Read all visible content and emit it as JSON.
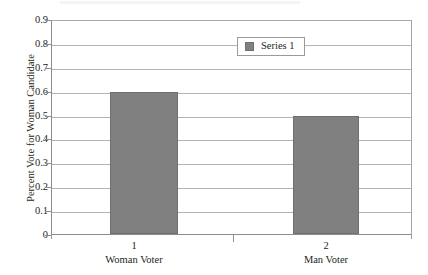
{
  "chart_data": {
    "type": "bar",
    "title": "",
    "subtitle": "",
    "xlabel": "",
    "ylabel": "Percent Vote for Woman Candidate",
    "categories": [
      "1",
      "2"
    ],
    "group_labels": [
      "Woman Voter",
      "Man Voter"
    ],
    "series": [
      {
        "name": "Series 1",
        "values": [
          0.6,
          0.5
        ],
        "color": "#808080"
      }
    ],
    "ylim": [
      0,
      0.9
    ],
    "ytick_step": 0.1,
    "ytick_labels": [
      "0.9",
      "0.8",
      "0.7",
      "0.6",
      "0.5",
      "0.4",
      "0.3",
      "0.2",
      "0.1",
      "0"
    ],
    "ytick_values": [
      0.9,
      0.8,
      0.7,
      0.6,
      0.5,
      0.4,
      0.3,
      0.2,
      0.1,
      0
    ],
    "grid": "horizontal",
    "legend": {
      "position": "inside-upper-right",
      "entries": [
        "Series 1"
      ]
    },
    "colors": {
      "bar_fill": "#808080",
      "bar_edge": "#6f6f6f",
      "gridline": "#b4b4b4",
      "axis": "#8d8d8d",
      "text": "#231f20",
      "background": "#ffffff"
    }
  }
}
